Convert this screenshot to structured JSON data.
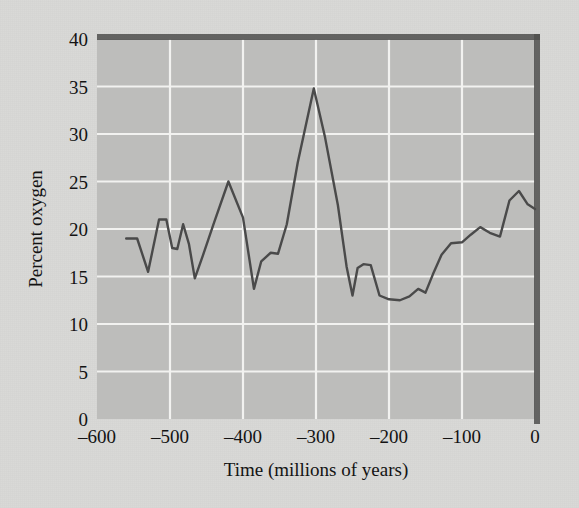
{
  "figure": {
    "background_color": "#d9d9d7",
    "plot_background_color": "#bdbdbb",
    "gridline_color": "#f2f2f0",
    "line_color": "#4a4a4a",
    "border_color": "#5a5a58"
  },
  "chart_data": {
    "type": "line",
    "title": "",
    "xlabel": "Time (millions of years)",
    "ylabel": "Percent oxygen",
    "xlim": [
      -600,
      0
    ],
    "ylim": [
      0,
      40
    ],
    "xticks": [
      -600,
      -500,
      -400,
      -300,
      -200,
      -100,
      0
    ],
    "xtick_labels": [
      "–600",
      "–500",
      "–400",
      "–300",
      "–200",
      "–100",
      "0"
    ],
    "yticks": [
      0,
      5,
      10,
      15,
      20,
      25,
      30,
      35,
      40
    ],
    "ytick_labels": [
      "0",
      "5",
      "10",
      "15",
      "20",
      "25",
      "30",
      "35",
      "40"
    ],
    "grid": true,
    "grid_axis": "both",
    "legend": false,
    "legend_position": "none",
    "series": [
      {
        "name": "Atmospheric oxygen",
        "x": [
          -560,
          -545,
          -530,
          -515,
          -505,
          -497,
          -490,
          -482,
          -474,
          -466,
          -455,
          -440,
          -420,
          -400,
          -385,
          -375,
          -362,
          -352,
          -340,
          -325,
          -303,
          -288,
          -270,
          -258,
          -250,
          -243,
          -235,
          -225,
          -213,
          -200,
          -185,
          -172,
          -160,
          -150,
          -140,
          -128,
          -115,
          -100,
          -88,
          -75,
          -62,
          -48,
          -35,
          -22,
          -10,
          0
        ],
        "y": [
          19.0,
          19.0,
          15.5,
          21.0,
          21.0,
          18.0,
          17.9,
          20.5,
          18.4,
          14.8,
          17.2,
          20.6,
          25.0,
          21.2,
          13.7,
          16.6,
          17.5,
          17.4,
          20.5,
          27.0,
          34.8,
          29.8,
          22.5,
          16.0,
          13.0,
          15.9,
          16.3,
          16.2,
          13.0,
          12.6,
          12.5,
          12.9,
          13.7,
          13.3,
          15.2,
          17.3,
          18.5,
          18.6,
          19.4,
          20.2,
          19.6,
          19.2,
          23.0,
          24.0,
          22.6,
          22.1
        ]
      }
    ]
  }
}
